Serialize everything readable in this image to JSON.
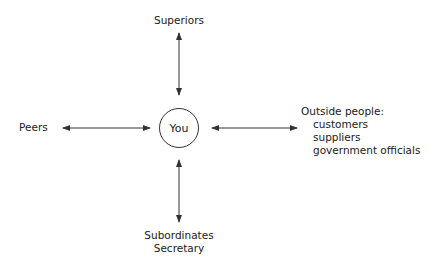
{
  "diagram": {
    "center": {
      "label": "You"
    },
    "nodes": {
      "top": {
        "label": "Superiors"
      },
      "left": {
        "label": "Peers"
      },
      "right": {
        "title": "Outside people:",
        "items": [
          "customers",
          "suppliers",
          "government officials"
        ]
      },
      "bottom": {
        "lines": [
          "Subordinates",
          "Secretary"
        ]
      }
    },
    "edges": [
      {
        "from": "You",
        "to": "Superiors",
        "type": "bidirectional"
      },
      {
        "from": "You",
        "to": "Peers",
        "type": "bidirectional"
      },
      {
        "from": "You",
        "to": "Outside people",
        "type": "bidirectional"
      },
      {
        "from": "You",
        "to": "Subordinates / Secretary",
        "type": "bidirectional"
      }
    ],
    "colors": {
      "line": "#333333",
      "text": "#1a1a1a",
      "background": "#ffffff"
    }
  }
}
